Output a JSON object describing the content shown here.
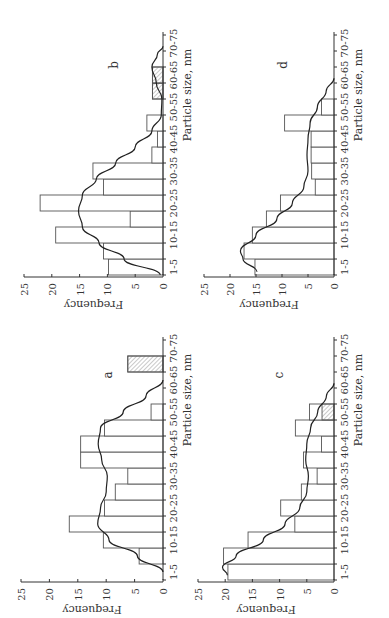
{
  "chart_data": [
    {
      "panel": "a",
      "type": "bar",
      "title": "a",
      "xlabel": "Particle size, nm",
      "ylabel": "Frequency",
      "ylim": [
        0,
        25
      ],
      "yticks": [
        "0",
        "5",
        "10",
        "15",
        "20",
        "25"
      ],
      "categories": [
        "1-5",
        "5-10",
        "10-15",
        "15-20",
        "20-25",
        "25-30",
        "30-35",
        "35-40",
        "40-45",
        "45-50",
        "50-55",
        "55-60",
        "60-65",
        "65-70",
        "70-75"
      ],
      "category_tick_labels": [
        "1-5",
        "10-15",
        "20-25",
        "30-35",
        "40-45",
        "50-55",
        "60-65",
        "70-75"
      ],
      "values": [
        0,
        4.2,
        10.5,
        16.5,
        10.3,
        8.4,
        6.2,
        14.5,
        14.5,
        10.3,
        2.1,
        0,
        0,
        6.2,
        0
      ],
      "hatched": [
        0,
        0,
        0,
        0,
        0,
        0,
        0,
        0,
        0,
        0,
        0,
        0,
        0,
        6.2,
        0
      ],
      "fit_curve": [
        [
          0,
          0
        ],
        [
          1,
          4.5
        ],
        [
          2,
          9.5
        ],
        [
          3,
          11.5
        ],
        [
          4,
          11
        ],
        [
          5,
          10
        ],
        [
          6,
          9.8
        ],
        [
          7,
          10.8
        ],
        [
          8,
          11.4
        ],
        [
          9,
          11
        ],
        [
          10,
          7
        ],
        [
          11,
          3
        ],
        [
          12,
          0
        ]
      ]
    },
    {
      "panel": "b",
      "type": "bar",
      "title": "b",
      "xlabel": "Particle size, nm",
      "ylabel": "Frequency",
      "ylim": [
        0,
        25
      ],
      "yticks": [
        "0",
        "5",
        "10",
        "15",
        "20",
        "25"
      ],
      "categories": [
        "1-5",
        "5-10",
        "10-15",
        "15-20",
        "20-25",
        "25-30",
        "30-35",
        "35-40",
        "40-45",
        "45-50",
        "50-55",
        "55-60",
        "60-65",
        "65-70",
        "70-75"
      ],
      "category_tick_labels": [
        "1-5",
        "10-15",
        "20-25",
        "30-35",
        "40-45",
        "50-55",
        "60-65",
        "70-75"
      ],
      "values": [
        9.8,
        10.7,
        19.3,
        5.9,
        22.1,
        10.7,
        12.6,
        2.0,
        1.0,
        2.9,
        0,
        1.9,
        1.9,
        0,
        0
      ],
      "hatched": [
        0,
        0,
        0,
        0,
        0,
        0,
        0,
        0,
        0,
        0,
        0,
        1.9,
        1.9,
        0,
        0
      ],
      "fit_curve": [
        [
          -0.5,
          0.5
        ],
        [
          0.5,
          7
        ],
        [
          1.5,
          11.5
        ],
        [
          2.5,
          14.5
        ],
        [
          3.5,
          15.2
        ],
        [
          4.5,
          14.5
        ],
        [
          5.5,
          12
        ],
        [
          6.5,
          8.5
        ],
        [
          7.5,
          5
        ],
        [
          8.5,
          2
        ],
        [
          9.5,
          0.3
        ],
        [
          10.5,
          0.2
        ],
        [
          11.5,
          1.2
        ],
        [
          12.5,
          2.0
        ],
        [
          13.3,
          1.0
        ],
        [
          13.8,
          0
        ]
      ]
    },
    {
      "panel": "c",
      "type": "bar",
      "title": "c",
      "xlabel": "Particle size, nm",
      "ylabel": "Frequency",
      "ylim": [
        0,
        25
      ],
      "yticks": [
        "0",
        "5",
        "10",
        "15",
        "20",
        "25"
      ],
      "categories": [
        "1-5",
        "5-10",
        "10-15",
        "15-20",
        "20-25",
        "25-30",
        "30-35",
        "35-40",
        "40-45",
        "45-50",
        "50-55",
        "55-60",
        "60-65",
        "65-70",
        "70-75"
      ],
      "category_tick_labels": [
        "1-5",
        "10-15",
        "20-25",
        "30-35",
        "40-45",
        "50-55",
        "60-65",
        "70-75"
      ],
      "values": [
        19.5,
        20.3,
        15.8,
        7.2,
        9.8,
        6.0,
        3.1,
        5.6,
        2.3,
        7.1,
        4.5,
        0,
        0,
        0,
        0
      ],
      "hatched": [
        0,
        0,
        0,
        0,
        0,
        0,
        0,
        0,
        0,
        0,
        2.2,
        0,
        0,
        0,
        0
      ],
      "fit_curve": [
        [
          -0.2,
          19.6
        ],
        [
          0.3,
          20.5
        ],
        [
          1,
          18
        ],
        [
          2,
          13
        ],
        [
          3,
          9
        ],
        [
          4,
          6.3
        ],
        [
          5,
          5
        ],
        [
          6,
          4.7
        ],
        [
          7,
          5.2
        ],
        [
          8,
          5
        ],
        [
          9,
          4.3
        ],
        [
          10,
          3
        ],
        [
          11,
          1.4
        ],
        [
          11.8,
          0
        ]
      ]
    },
    {
      "panel": "d",
      "type": "bar",
      "title": "d",
      "xlabel": "Particle size, nm",
      "ylabel": "Frequency",
      "ylim": [
        0,
        25
      ],
      "yticks": [
        "0",
        "5",
        "10",
        "15",
        "20",
        "25"
      ],
      "categories": [
        "1-5",
        "5-10",
        "10-15",
        "15-20",
        "20-25",
        "25-30",
        "30-35",
        "35-40",
        "40-45",
        "45-50",
        "50-55",
        "55-60",
        "60-65",
        "65-70",
        "70-75"
      ],
      "category_tick_labels": [
        "1-5",
        "10-15",
        "20-25",
        "30-35",
        "40-45",
        "50-55",
        "60-65",
        "70-75"
      ],
      "values": [
        15.2,
        17.3,
        15.7,
        13.0,
        10.3,
        3.6,
        4.3,
        4.4,
        4.4,
        9.5,
        2.4,
        0,
        0,
        0,
        0
      ],
      "hatched": [
        0,
        0,
        0,
        0,
        0,
        0,
        0,
        0,
        0,
        0,
        0,
        0,
        0,
        0,
        0
      ],
      "fit_curve": [
        [
          -0.3,
          14.8
        ],
        [
          0.5,
          17.5
        ],
        [
          1,
          18
        ],
        [
          2,
          15
        ],
        [
          3,
          11
        ],
        [
          4,
          8
        ],
        [
          5,
          5.8
        ],
        [
          6,
          5.0
        ],
        [
          7,
          5.2
        ],
        [
          8,
          5.0
        ],
        [
          9,
          4.6
        ],
        [
          10,
          3.2
        ],
        [
          11,
          1.5
        ],
        [
          11.8,
          0
        ]
      ]
    }
  ]
}
